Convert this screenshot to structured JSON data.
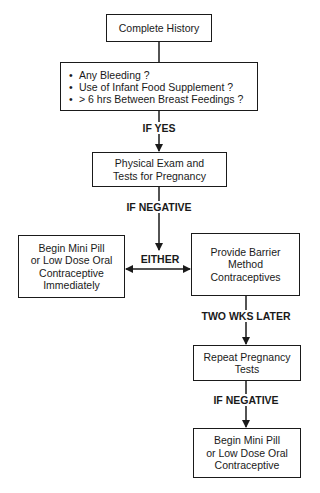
{
  "diagram": {
    "type": "flowchart",
    "nodes": {
      "complete_history": "Complete History",
      "screening_questions": [
        "Any Bleeding ?",
        "Use of Infant Food Supplement ?",
        "> 6 hrs  Between  Breast  Feedings ?"
      ],
      "physical_exam": "Physical Exam and\nTests for Pregnancy",
      "begin_mini_pill_immediately": "Begin Mini Pill\nor Low Dose Oral\nContraceptive\nImmediately",
      "barrier_method": "Provide Barrier\nMethod\nContraceptives",
      "repeat_tests": "Repeat Pregnancy\nTests",
      "begin_mini_pill_final": "Begin Mini Pill\nor Low Dose Oral\nContraceptive"
    },
    "edge_labels": {
      "if_yes": "IF YES",
      "if_negative_1": "IF NEGATIVE",
      "either": "EITHER",
      "two_wks_later": "TWO WKS LATER",
      "if_negative_2": "IF NEGATIVE"
    },
    "colors": {
      "line": "#1a1a1a",
      "background": "#ffffff"
    }
  }
}
